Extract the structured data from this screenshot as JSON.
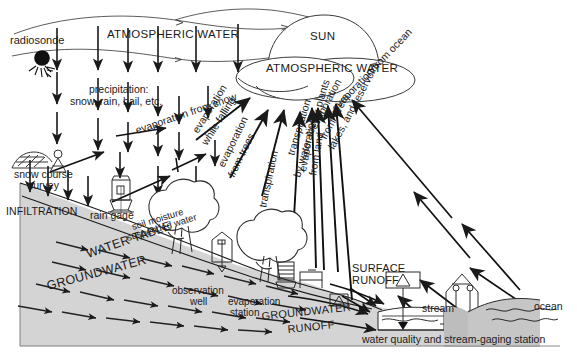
{
  "diagram": {
    "colors": {
      "ink": "#1a1a1a",
      "line": "#2a2a2a",
      "ground_fill": "#d4d4d4",
      "ground_fill_dark": "#bdbdbd",
      "background": "#ffffff",
      "frame": "#6e6e6e"
    },
    "labels": {
      "radiosonde": "radiosonde",
      "atmospheric_water_top": "ATMOSPHERIC WATER",
      "sun": "SUN",
      "atmospheric_water_cloud": "ATMOSPHERIC WATER",
      "precipitation_line1": "precipitation:",
      "precipitation_line2": "snow, rain, hail, etc.",
      "evaporation_from_snow": "evaporation from snow",
      "evaporation_while_falling_line1": "evaporation",
      "evaporation_while_falling_line2": "while falling",
      "evaporation_from_trees_line1": "evaporation",
      "evaporation_from_trees_line2": "from trees",
      "transpiration": "transpiration",
      "evaporation_from_land_line1": "evaporation",
      "evaporation_from_land_line2": "from land",
      "transpiration_plants_line1": "transpiration",
      "transpiration_plants_line2": "by water-loving plants",
      "evaporation_rivers_line1": "evaporation",
      "evaporation_rivers_line2": "from rivers,",
      "evaporation_rivers_line3": "lakes, and reservoirs",
      "evaporation_from_ocean": "evaporation from ocean",
      "snow_course_line1": "snow course",
      "snow_course_line2": "survey",
      "infiltration": "INFILTRATION",
      "rain_gage": "rain gage",
      "soil_moisture_line1": "soil moisture",
      "soil_moisture_line2": "suspended water",
      "water_table": "WATER TABLE",
      "groundwater": "GROUNDWATER",
      "observation_well_line1": "observation",
      "observation_well_line2": "well",
      "evaporation_station_line1": "evaporation",
      "evaporation_station_line2": "station",
      "groundwater_runoff_line1": "GROUNDWATER",
      "groundwater_runoff_line2": "RUNOFF",
      "surface_runoff_line1": "SURFACE",
      "surface_runoff_line2": "RUNOFF",
      "stream": "stream",
      "ocean": "ocean",
      "gaging_station": "water quality and stream-gaging station"
    }
  }
}
